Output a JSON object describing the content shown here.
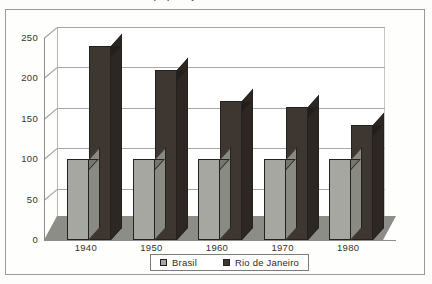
{
  "figure": {
    "title_clipped": "Crescimento da população do Brasil e do Rio de Janeiro",
    "frame_color": "#9a9a94",
    "background_color": "#fdfdfc"
  },
  "chart_data": {
    "type": "bar",
    "title": "",
    "xlabel": "",
    "ylabel": "",
    "categories": [
      "1940",
      "1950",
      "1960",
      "1970",
      "1980"
    ],
    "series": [
      {
        "name": "Brasil",
        "color": "#a7a7a1",
        "values": [
          100,
          100,
          100,
          100,
          100
        ]
      },
      {
        "name": "Rio de Janeiro",
        "color": "#3d3631",
        "values": [
          240,
          210,
          172,
          165,
          142
        ]
      }
    ],
    "ylim": [
      0,
      250
    ],
    "yticks": [
      0,
      50,
      100,
      150,
      200,
      250
    ],
    "ytick_labels": [
      "0",
      "50",
      "100",
      "150",
      "200",
      "250"
    ],
    "grid": true,
    "grid_axis": "y",
    "legend_position": "bottom-center",
    "three_d": true
  }
}
